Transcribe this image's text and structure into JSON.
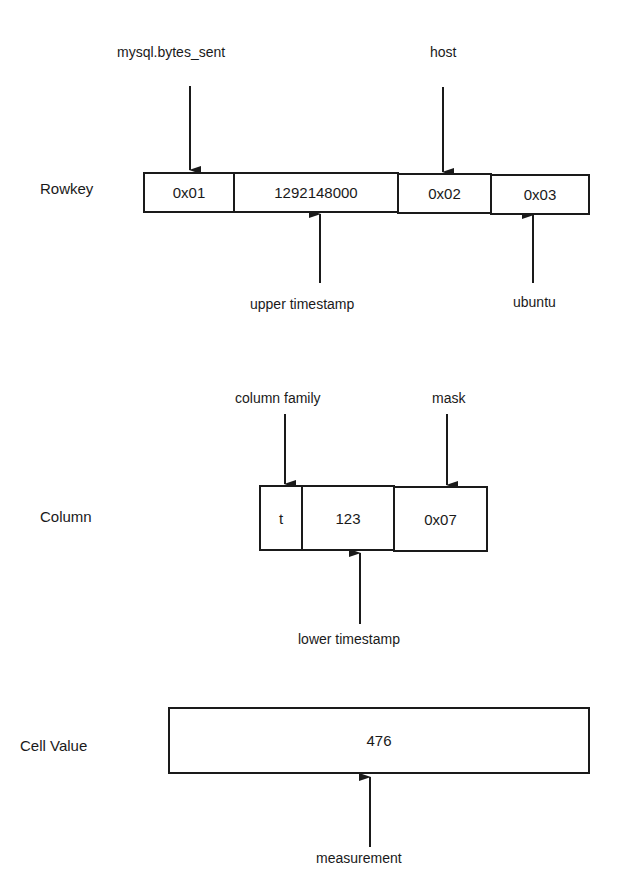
{
  "rowkey": {
    "label": "Rowkey",
    "cells": [
      "0x01",
      "1292148000",
      "0x02",
      "0x03"
    ],
    "annotations": {
      "metric": "mysql.bytes_sent",
      "host_tag": "host",
      "upper_timestamp": "upper timestamp",
      "host_value": "ubuntu"
    }
  },
  "column": {
    "label": "Column",
    "cells": [
      "t",
      "123",
      "0x07"
    ],
    "annotations": {
      "family": "column family",
      "mask": "mask",
      "lower_timestamp": "lower timestamp"
    }
  },
  "cell_value": {
    "label": "Cell Value",
    "value": "476",
    "annotations": {
      "measurement": "measurement"
    }
  }
}
